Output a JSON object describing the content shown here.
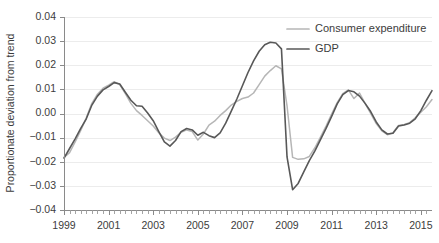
{
  "figure": {
    "cropped_title": "",
    "background": "#ffffff"
  },
  "axes": {
    "y_title": "Proportionate deviation from trend",
    "y_ticks": [
      "0.04",
      "0.03",
      "0.02",
      "0.01",
      "0.00",
      "−0.01",
      "−0.02",
      "−0.03",
      "−0.04"
    ],
    "x_ticks": [
      "1999",
      "2001",
      "2003",
      "2005",
      "2007",
      "2009",
      "2011",
      "2013",
      "2015"
    ]
  },
  "legend": {
    "position": "top-right",
    "entries": [
      {
        "label": "Consumer expenditure",
        "color": "#b6b6b6"
      },
      {
        "label": "GDP",
        "color": "#585858"
      }
    ]
  },
  "chart_data": {
    "type": "line",
    "title": "",
    "xlabel": "",
    "ylabel": "Proportionate deviation from trend",
    "xlim": [
      1999.0,
      2015.5
    ],
    "ylim": [
      -0.04,
      0.04
    ],
    "ytick_values": [
      0.04,
      0.03,
      0.02,
      0.01,
      0.0,
      -0.01,
      -0.02,
      -0.03,
      -0.04
    ],
    "xtick_values": [
      1999,
      2001,
      2003,
      2005,
      2007,
      2009,
      2011,
      2013,
      2015
    ],
    "grid": "horizontal",
    "minor_tick_interval_years": 0.25,
    "legend_position": "top-right",
    "x": [
      1999.0,
      1999.25,
      1999.5,
      1999.75,
      2000.0,
      2000.25,
      2000.5,
      2000.75,
      2001.0,
      2001.25,
      2001.5,
      2001.75,
      2002.0,
      2002.25,
      2002.5,
      2002.75,
      2003.0,
      2003.25,
      2003.5,
      2003.75,
      2004.0,
      2004.25,
      2004.5,
      2004.75,
      2005.0,
      2005.25,
      2005.5,
      2005.75,
      2006.0,
      2006.25,
      2006.5,
      2006.75,
      2007.0,
      2007.25,
      2007.5,
      2007.75,
      2008.0,
      2008.25,
      2008.5,
      2008.75,
      2009.0,
      2009.25,
      2009.5,
      2009.75,
      2010.0,
      2010.25,
      2010.5,
      2010.75,
      2011.0,
      2011.25,
      2011.5,
      2011.75,
      2012.0,
      2012.25,
      2012.5,
      2012.75,
      2013.0,
      2013.25,
      2013.5,
      2013.75,
      2014.0,
      2014.25,
      2014.5,
      2014.75,
      2015.0,
      2015.25,
      2015.5
    ],
    "series": [
      {
        "name": "GDP",
        "color": "#585858",
        "values": [
          -0.0185,
          -0.0145,
          -0.0105,
          -0.0062,
          -0.0022,
          0.0035,
          0.0072,
          0.0098,
          0.0112,
          0.0128,
          0.0122,
          0.0088,
          0.0055,
          0.0032,
          0.003,
          0.0002,
          -0.003,
          -0.0075,
          -0.0118,
          -0.0135,
          -0.0112,
          -0.0075,
          -0.0062,
          -0.0068,
          -0.009,
          -0.0078,
          -0.0092,
          -0.01,
          -0.008,
          -0.004,
          0.001,
          0.006,
          0.0115,
          0.017,
          0.0218,
          0.0258,
          0.0285,
          0.0295,
          0.0292,
          0.0268,
          -0.018,
          -0.0316,
          -0.029,
          -0.0242,
          -0.0195,
          -0.0155,
          -0.0108,
          -0.0062,
          -0.0012,
          0.004,
          0.0078,
          0.0095,
          0.009,
          0.0072,
          0.0042,
          0.0008,
          -0.0035,
          -0.0068,
          -0.0085,
          -0.0082,
          -0.0052,
          -0.0048,
          -0.004,
          -0.0022,
          0.0012,
          0.0055,
          0.0095
        ]
      },
      {
        "name": "Consumer expenditure",
        "color": "#b6b6b6",
        "values": [
          -0.0182,
          -0.0162,
          -0.0118,
          -0.007,
          -0.0018,
          0.0042,
          0.008,
          0.0105,
          0.0118,
          0.0132,
          0.012,
          0.0082,
          0.0042,
          0.0012,
          -0.0008,
          -0.003,
          -0.0052,
          -0.008,
          -0.0102,
          -0.0112,
          -0.0098,
          -0.0078,
          -0.0068,
          -0.0075,
          -0.011,
          -0.0085,
          -0.0048,
          -0.0032,
          -0.0008,
          0.0012,
          0.0035,
          0.005,
          0.0062,
          0.0068,
          0.0085,
          0.012,
          0.0155,
          0.0178,
          0.0198,
          0.0185,
          0.0032,
          -0.0182,
          -0.019,
          -0.0188,
          -0.0178,
          -0.0142,
          -0.0098,
          -0.0052,
          -0.0002,
          0.0045,
          0.0082,
          0.0098,
          0.0062,
          0.0085,
          0.0042,
          0.0,
          -0.0042,
          -0.0072,
          -0.0088,
          -0.008,
          -0.005,
          -0.0045,
          -0.0038,
          -0.0018,
          0.0005,
          0.0028,
          0.0058
        ]
      }
    ]
  }
}
